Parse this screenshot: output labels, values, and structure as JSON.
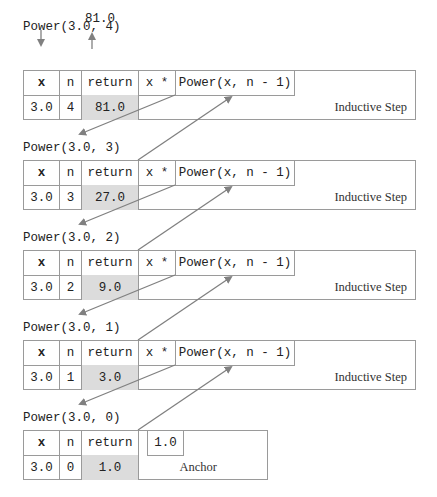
{
  "top": {
    "result": "81.0",
    "down_arrow": "call-arrow",
    "up_arrow": "return-arrow"
  },
  "columns": {
    "x": "x",
    "n": "n",
    "return": "return",
    "mult": "x *",
    "recursive_call": "Power(x, n - 1)"
  },
  "frames": [
    {
      "title": "Power(3.0, 4)",
      "x": "3.0",
      "n": "4",
      "return": "81.0",
      "label": "Inductive Step"
    },
    {
      "title": "Power(3.0, 3)",
      "x": "3.0",
      "n": "3",
      "return": "27.0",
      "label": "Inductive Step"
    },
    {
      "title": "Power(3.0, 2)",
      "x": "3.0",
      "n": "2",
      "return": "9.0",
      "label": "Inductive Step"
    },
    {
      "title": "Power(3.0, 1)",
      "x": "3.0",
      "n": "1",
      "return": "3.0",
      "label": "Inductive Step"
    },
    {
      "title": "Power(3.0, 0)",
      "x": "3.0",
      "n": "0",
      "return": "1.0",
      "label": "Anchor",
      "anchor_value": "1.0"
    }
  ],
  "colors": {
    "border": "#9a9a9a",
    "return_fill": "#dcdcdc",
    "arrow": "#808080"
  }
}
